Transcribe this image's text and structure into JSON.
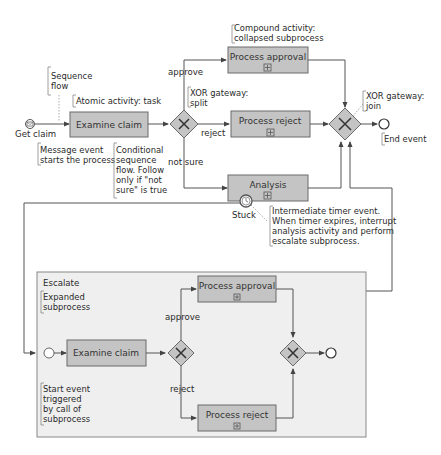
{
  "colors": {
    "task_fill": "#c4c4c4",
    "task_stroke": "#6a6a6a",
    "line": "#555555",
    "subprocess_fill": "#efefef",
    "subprocess_stroke": "#888888"
  },
  "main_process": {
    "start_event": {
      "label": "Get claim",
      "icon": "message-start-event-icon"
    },
    "tasks": {
      "examine_claim": "Examine claim",
      "process_approval": "Process approval",
      "process_reject": "Process reject",
      "analysis": "Analysis"
    },
    "flow_labels": {
      "approve": "approve",
      "reject": "reject",
      "not_sure": "not sure"
    },
    "timer_label": "Stuck",
    "end_event_icon": "end-event-icon"
  },
  "annotations": {
    "sequence_flow": [
      "Sequence",
      "flow"
    ],
    "atomic_activity": [
      "Atomic activity: task"
    ],
    "message_event": [
      "Message event",
      "starts the process"
    ],
    "conditional_flow": [
      "Conditional",
      "sequence",
      "flow. Follow",
      "only if \"not",
      "sure\" is true"
    ],
    "xor_split": [
      "XOR gateway:",
      "split"
    ],
    "compound_activity": [
      "Compound activity:",
      "collapsed subprocess"
    ],
    "xor_join": [
      "XOR gateway:",
      "join"
    ],
    "end_event": [
      "End event"
    ],
    "timer_event": [
      "Intermediate timer event.",
      "When timer expires, interrupt",
      "analysis activity and perform",
      "escalate subprocess."
    ]
  },
  "subprocess": {
    "title": "Escalate",
    "expanded_note": [
      "Expanded",
      "subprocess"
    ],
    "start_note": [
      "Start event",
      "triggered",
      "by call of",
      "subprocess"
    ],
    "tasks": {
      "examine_claim": "Examine claim",
      "process_approval": "Process approval",
      "process_reject": "Process reject"
    },
    "flow_labels": {
      "approve": "approve",
      "reject": "reject"
    }
  }
}
